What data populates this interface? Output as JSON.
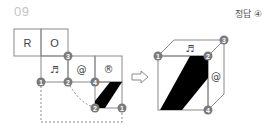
{
  "question": {
    "number": "09"
  },
  "answer": {
    "label": "정답 ④"
  },
  "net": {
    "cells": [
      {
        "id": "r",
        "text": "R"
      },
      {
        "id": "o",
        "text": "O"
      },
      {
        "id": "music",
        "text": "♬"
      },
      {
        "id": "at",
        "text": "@"
      },
      {
        "id": "registered",
        "text": "®"
      }
    ],
    "vertex_labels": {
      "v3": "3",
      "v1": "1",
      "v2": "2",
      "v4": "4",
      "v2b": "2",
      "v1b": "1"
    }
  },
  "arrow": {
    "icon": "right-arrow-icon"
  },
  "cube": {
    "top_symbol": "♬",
    "right_symbol": "@",
    "vertex_labels": {
      "v1": "1",
      "v2": "2",
      "v3": "3",
      "v4": "4"
    }
  },
  "colors": {
    "line": "#8a8a8a",
    "badge": "#7a7a7a",
    "fill": "#000000"
  }
}
